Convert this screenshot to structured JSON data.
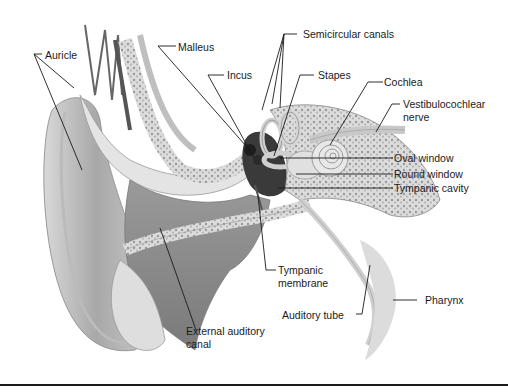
{
  "figure": {
    "labels": {
      "auricle": "Auricle",
      "malleus": "Malleus",
      "incus": "Incus",
      "semicircular_canals": "Semicircular canals",
      "stapes": "Stapes",
      "cochlea": "Cochlea",
      "vestibulocochlear_1": "Vestibulocochlear",
      "vestibulocochlear_2": "nerve",
      "oval_window": "Oval window",
      "round_window": "Round window",
      "tympanic_cavity": "Tympanic cavity",
      "tympanic_membrane_1": "Tympanic",
      "tympanic_membrane_2": "membrane",
      "auditory_tube": "Auditory tube",
      "pharynx": "Pharynx",
      "external_canal_1": "External auditory",
      "external_canal_2": "canal"
    }
  },
  "colors": {
    "background": "#ffffff",
    "text": "#1a1a1a",
    "leader": "#1a1a1a",
    "skin_light": "#e6e6e6",
    "skin_mid": "#bdbdbd",
    "skin_dark": "#8a8a8a",
    "bone": "#d4d4d4",
    "cavity": "#3a3a3a"
  }
}
